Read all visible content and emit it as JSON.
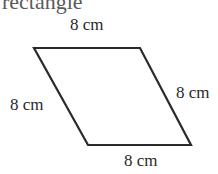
{
  "title_fragment": "rectangle",
  "shape": {
    "type": "rhombus",
    "vertices": [
      [
        34,
        48
      ],
      [
        140,
        48
      ],
      [
        191,
        145
      ],
      [
        88,
        145
      ]
    ],
    "stroke": "#2a2a2a"
  },
  "labels": {
    "top": "8 cm",
    "left": "8 cm",
    "right": "8 cm",
    "bottom": "8 cm"
  }
}
